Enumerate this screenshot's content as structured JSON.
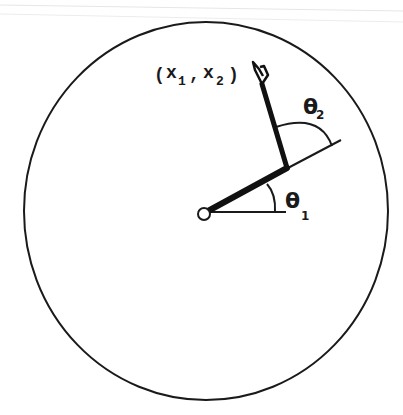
{
  "figure": {
    "type": "two-link planar robot arm in circular workspace",
    "colors": {
      "background": "#ffffff",
      "stroke": "#1a1a1a",
      "scan_lines": "#e4e4e4"
    }
  },
  "labels": {
    "end_effector": {
      "open": "(",
      "x1": "x",
      "x1_sub": "1",
      "comma": ",",
      "x2": "x",
      "x2_sub": "2",
      "close": ")"
    },
    "theta1": {
      "symbol": "θ",
      "sub": "1"
    },
    "theta2": {
      "symbol": "θ",
      "sub": "2"
    }
  },
  "geometry": {
    "workspace_circle": {
      "cx": 206,
      "cy": 211,
      "rx": 182,
      "ry": 189
    },
    "base_pivot": {
      "cx": 204,
      "cy": 214,
      "r": 6
    },
    "elbow": {
      "x": 286,
      "y": 169
    },
    "end_effector": {
      "x": 260,
      "y": 78
    }
  }
}
